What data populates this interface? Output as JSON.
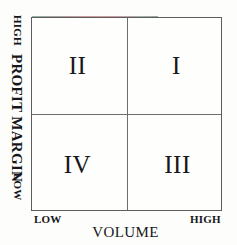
{
  "diagram": {
    "type": "quadrant-matrix",
    "rows": 2,
    "columns": 2,
    "quadrants": [
      {
        "id": "I",
        "label": "I",
        "position": "top-right",
        "volume": "HIGH",
        "profit_margin": "HIGH"
      },
      {
        "id": "II",
        "label": "II",
        "position": "top-left",
        "volume": "LOW",
        "profit_margin": "HIGH"
      },
      {
        "id": "III",
        "label": "III",
        "position": "bottom-right",
        "volume": "HIGH",
        "profit_margin": "LOW"
      },
      {
        "id": "IV",
        "label": "IV",
        "position": "bottom-left",
        "volume": "LOW",
        "profit_margin": "LOW"
      }
    ],
    "y_axis": {
      "title": "PROFIT MARGIN",
      "high_label": "HIGH",
      "low_label": "LOW"
    },
    "x_axis": {
      "title": "VOLUME",
      "low_label": "LOW",
      "high_label": "HIGH"
    },
    "colors": {
      "background": "#fdfdfb",
      "border": "#5d5d5d",
      "divider": "#6e6e6e",
      "text": "#16161a"
    }
  }
}
